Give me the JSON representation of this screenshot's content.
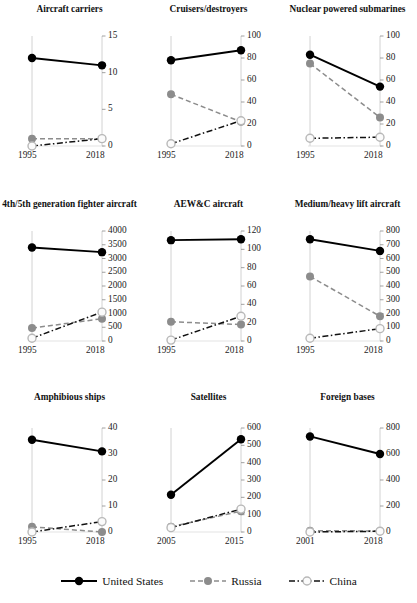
{
  "figure": {
    "legend": [
      {
        "name": "United States",
        "color": "#000000",
        "style": "solid",
        "marker": "filled"
      },
      {
        "name": "Russia",
        "color": "#8c8c8c",
        "style": "dashed",
        "marker": "filled"
      },
      {
        "name": "China",
        "color": "#000000",
        "style": "dashdot",
        "marker": "open"
      }
    ]
  },
  "chart_data": [
    {
      "type": "line",
      "title": "Aircraft carriers",
      "x": [
        "1995",
        "2018"
      ],
      "ylim": [
        0,
        15
      ],
      "yticks": [
        0,
        5,
        10,
        15
      ],
      "xlabel": "",
      "ylabel": "",
      "grid": false,
      "legend_position": "bottom",
      "series": [
        {
          "name": "United States",
          "values": [
            12,
            11
          ]
        },
        {
          "name": "Russia",
          "values": [
            1,
            1
          ]
        },
        {
          "name": "China",
          "values": [
            0,
            1
          ]
        }
      ]
    },
    {
      "type": "line",
      "title": "Cruisers/destroyers",
      "x": [
        "1995",
        "2018"
      ],
      "ylim": [
        0,
        100
      ],
      "yticks": [
        0,
        20,
        40,
        60,
        80,
        100
      ],
      "xlabel": "",
      "ylabel": "",
      "grid": false,
      "legend_position": "bottom",
      "series": [
        {
          "name": "United States",
          "values": [
            78,
            87
          ]
        },
        {
          "name": "Russia",
          "values": [
            47,
            22
          ]
        },
        {
          "name": "China",
          "values": [
            2,
            23
          ]
        }
      ]
    },
    {
      "type": "line",
      "title": "Nuclear powered submarines",
      "x": [
        "1995",
        "2018"
      ],
      "ylim": [
        0,
        100
      ],
      "yticks": [
        0,
        20,
        40,
        60,
        80,
        100
      ],
      "xlabel": "",
      "ylabel": "",
      "grid": false,
      "legend_position": "bottom",
      "series": [
        {
          "name": "United States",
          "values": [
            83,
            54
          ]
        },
        {
          "name": "Russia",
          "values": [
            75,
            26
          ]
        },
        {
          "name": "China",
          "values": [
            7,
            8
          ]
        }
      ]
    },
    {
      "type": "line",
      "title": "4th/5th generation fighter aircraft",
      "x": [
        "1995",
        "2018"
      ],
      "ylim": [
        0,
        4000
      ],
      "yticks": [
        0,
        500,
        1000,
        1500,
        2000,
        2500,
        3000,
        3500,
        4000
      ],
      "xlabel": "",
      "ylabel": "",
      "grid": false,
      "legend_position": "bottom",
      "series": [
        {
          "name": "United States",
          "values": [
            3400,
            3230
          ]
        },
        {
          "name": "Russia",
          "values": [
            470,
            810
          ]
        },
        {
          "name": "China",
          "values": [
            100,
            1050
          ]
        }
      ]
    },
    {
      "type": "line",
      "title": "AEW&C aircraft",
      "x": [
        "1995",
        "2018"
      ],
      "ylim": [
        0,
        120
      ],
      "yticks": [
        0,
        20,
        40,
        60,
        80,
        100,
        120
      ],
      "xlabel": "",
      "ylabel": "",
      "grid": false,
      "legend_position": "bottom",
      "series": [
        {
          "name": "United States",
          "values": [
            110,
            111
          ]
        },
        {
          "name": "Russia",
          "values": [
            21,
            18
          ]
        },
        {
          "name": "China",
          "values": [
            1,
            27
          ]
        }
      ]
    },
    {
      "type": "line",
      "title": "Medium/heavy lift aircraft",
      "x": [
        "1995",
        "2018"
      ],
      "ylim": [
        0,
        800
      ],
      "yticks": [
        0,
        100,
        200,
        300,
        400,
        500,
        600,
        700,
        800
      ],
      "xlabel": "",
      "ylabel": "",
      "grid": false,
      "legend_position": "bottom",
      "series": [
        {
          "name": "United States",
          "values": [
            740,
            655
          ]
        },
        {
          "name": "Russia",
          "values": [
            470,
            180
          ]
        },
        {
          "name": "China",
          "values": [
            20,
            90
          ]
        }
      ]
    },
    {
      "type": "line",
      "title": "Amphibious ships",
      "x": [
        "1995",
        "2018"
      ],
      "ylim": [
        0,
        40
      ],
      "yticks": [
        0,
        10,
        20,
        30,
        40
      ],
      "xlabel": "",
      "ylabel": "",
      "grid": false,
      "legend_position": "bottom",
      "series": [
        {
          "name": "United States",
          "values": [
            35.5,
            31
          ]
        },
        {
          "name": "Russia",
          "values": [
            2,
            0
          ]
        },
        {
          "name": "China",
          "values": [
            0,
            4
          ]
        }
      ]
    },
    {
      "type": "line",
      "title": "Satellites",
      "x": [
        "2005",
        "2015"
      ],
      "ylim": [
        0,
        600
      ],
      "yticks": [
        0,
        100,
        200,
        300,
        400,
        500,
        600
      ],
      "xlabel": "",
      "ylabel": "",
      "grid": false,
      "legend_position": "bottom",
      "series": [
        {
          "name": "United States",
          "values": [
            215,
            535
          ]
        },
        {
          "name": "Russia",
          "values": [
            30,
            120
          ]
        },
        {
          "name": "China",
          "values": [
            25,
            132
          ]
        }
      ]
    },
    {
      "type": "line",
      "title": "Foreign bases",
      "x": [
        "2001",
        "2018"
      ],
      "ylim": [
        0,
        800
      ],
      "yticks": [
        0,
        200,
        400,
        600,
        800
      ],
      "xlabel": "",
      "ylabel": "",
      "grid": false,
      "legend_position": "bottom",
      "series": [
        {
          "name": "United States",
          "values": [
            735,
            600
          ]
        },
        {
          "name": "Russia",
          "values": [
            10,
            8
          ]
        },
        {
          "name": "China",
          "values": [
            0,
            6
          ]
        }
      ]
    }
  ]
}
